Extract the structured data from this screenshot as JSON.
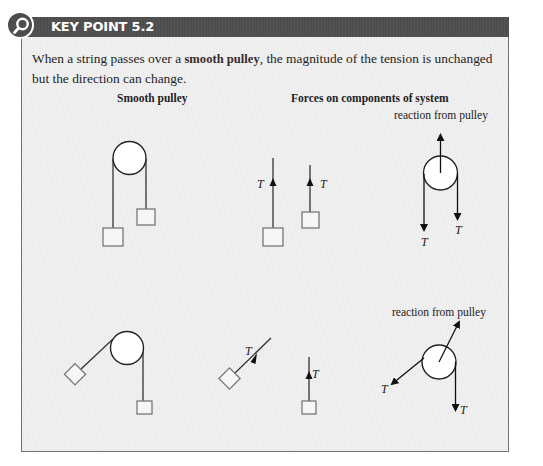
{
  "key_point": {
    "title": "KEY POINT 5.2",
    "icon": "magnifier-icon",
    "text_before": "When a string passes over a ",
    "text_emphasis": "smooth pulley",
    "text_after": ", the magnitude of the tension is unchanged but the direction can change."
  },
  "columns": {
    "left_heading": "Smooth pulley",
    "right_heading": "Forces on components of system"
  },
  "labels": {
    "reaction_top": "reaction from pulley",
    "reaction_bottom": "reaction from pulley",
    "tension": "T"
  },
  "colors": {
    "header_bg": "#4d4d4d",
    "body_bg": "#ececec",
    "border": "#707070"
  }
}
